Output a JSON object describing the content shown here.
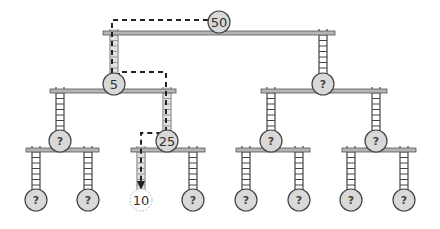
{
  "diagram": {
    "colors": {
      "shelf_fill": "#b5b5b5",
      "shelf_stroke": "#555555",
      "node_fill": "#d9d9d9",
      "node_stroke": "#444444",
      "found_fill": "#ffffff",
      "found_stroke": "#bbbbbb",
      "ladder": "#444444",
      "path": "#222222",
      "highlight_ladder": "#cfcfcf"
    },
    "nodes": [
      {
        "id": "n50",
        "label": "50",
        "x": 219,
        "y": 22,
        "r": 11,
        "type": "known"
      },
      {
        "id": "n5",
        "label": "5",
        "x": 114,
        "y": 84,
        "r": 11,
        "type": "known"
      },
      {
        "id": "nR1",
        "label": "?",
        "x": 323,
        "y": 84,
        "r": 11,
        "type": "unknown"
      },
      {
        "id": "nLL",
        "label": "?",
        "x": 60,
        "y": 141,
        "r": 11,
        "type": "unknown"
      },
      {
        "id": "n25",
        "label": "25",
        "x": 167,
        "y": 141,
        "r": 11,
        "type": "known"
      },
      {
        "id": "nRL",
        "label": "?",
        "x": 271,
        "y": 141,
        "r": 11,
        "type": "unknown"
      },
      {
        "id": "nRR",
        "label": "?",
        "x": 376,
        "y": 141,
        "r": 11,
        "type": "unknown"
      },
      {
        "id": "leaf1",
        "label": "?",
        "x": 36,
        "y": 200,
        "r": 11,
        "type": "unknown"
      },
      {
        "id": "leaf2",
        "label": "?",
        "x": 88,
        "y": 200,
        "r": 11,
        "type": "unknown"
      },
      {
        "id": "n10",
        "label": "10",
        "x": 141,
        "y": 200,
        "r": 11,
        "type": "found"
      },
      {
        "id": "leaf4",
        "label": "?",
        "x": 193,
        "y": 200,
        "r": 11,
        "type": "unknown"
      },
      {
        "id": "leaf5",
        "label": "?",
        "x": 246,
        "y": 200,
        "r": 11,
        "type": "unknown"
      },
      {
        "id": "leaf6",
        "label": "?",
        "x": 299,
        "y": 200,
        "r": 11,
        "type": "unknown"
      },
      {
        "id": "leaf7",
        "label": "?",
        "x": 351,
        "y": 200,
        "r": 11,
        "type": "unknown"
      },
      {
        "id": "leaf8",
        "label": "?",
        "x": 404,
        "y": 200,
        "r": 11,
        "type": "unknown"
      }
    ],
    "shelves": [
      {
        "id": "shelf-root",
        "x1": 103,
        "x2": 335,
        "y": 33
      },
      {
        "id": "shelf-5",
        "x1": 50,
        "x2": 176,
        "y": 91
      },
      {
        "id": "shelf-r1",
        "x1": 261,
        "x2": 387,
        "y": 91
      },
      {
        "id": "shelf-ll",
        "x1": 26,
        "x2": 99,
        "y": 150
      },
      {
        "id": "shelf-25",
        "x1": 131,
        "x2": 205,
        "y": 150
      },
      {
        "id": "shelf-rl",
        "x1": 236,
        "x2": 310,
        "y": 150
      },
      {
        "id": "shelf-rr",
        "x1": 342,
        "x2": 416,
        "y": 150
      }
    ],
    "ladders": [
      {
        "id": "ladder-root-left",
        "x": 114,
        "y1": 29,
        "y2": 74,
        "highlight": true
      },
      {
        "id": "ladder-root-right",
        "x": 323,
        "y1": 29,
        "y2": 74,
        "highlight": false
      },
      {
        "id": "ladder-5-left",
        "x": 60,
        "y1": 87,
        "y2": 131,
        "highlight": false
      },
      {
        "id": "ladder-5-right",
        "x": 167,
        "y1": 87,
        "y2": 131,
        "highlight": true
      },
      {
        "id": "ladder-r1-left",
        "x": 271,
        "y1": 87,
        "y2": 131,
        "highlight": false
      },
      {
        "id": "ladder-r1-right",
        "x": 376,
        "y1": 87,
        "y2": 131,
        "highlight": false
      },
      {
        "id": "ladder-ll-left",
        "x": 36,
        "y1": 146,
        "y2": 190,
        "highlight": false
      },
      {
        "id": "ladder-ll-right",
        "x": 88,
        "y1": 146,
        "y2": 190,
        "highlight": false
      },
      {
        "id": "ladder-25-left",
        "x": 141,
        "y1": 146,
        "y2": 190,
        "highlight": true
      },
      {
        "id": "ladder-25-right",
        "x": 193,
        "y1": 146,
        "y2": 190,
        "highlight": false
      },
      {
        "id": "ladder-rl-left",
        "x": 246,
        "y1": 146,
        "y2": 190,
        "highlight": false
      },
      {
        "id": "ladder-rl-right",
        "x": 299,
        "y1": 146,
        "y2": 190,
        "highlight": false
      },
      {
        "id": "ladder-rr-left",
        "x": 351,
        "y1": 146,
        "y2": 190,
        "highlight": false
      },
      {
        "id": "ladder-rr-right",
        "x": 404,
        "y1": 146,
        "y2": 190,
        "highlight": false
      }
    ],
    "search_path": [
      [
        208,
        20
      ],
      [
        112,
        20
      ],
      [
        112,
        74
      ],
      [
        120,
        74
      ],
      [
        120,
        72
      ],
      [
        166,
        72
      ],
      [
        166,
        131
      ],
      [
        160,
        133
      ],
      [
        141,
        133
      ],
      [
        141,
        183
      ]
    ],
    "arrow_tip": {
      "x": 141,
      "y": 190
    }
  }
}
